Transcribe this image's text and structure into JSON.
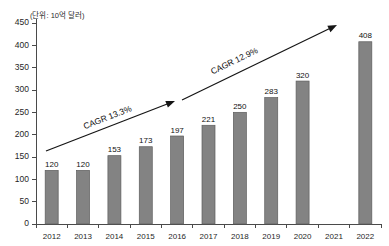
{
  "chart_data": {
    "type": "bar",
    "title": "",
    "subtitle": "",
    "unit_note": "(단위: 10억 달러)",
    "xlabel": "",
    "ylabel": "",
    "ylim": [
      0,
      450
    ],
    "ytick_step": 50,
    "grid": false,
    "legend": "none",
    "categories": [
      "2012",
      "2013",
      "2014",
      "2015",
      "2016",
      "2017",
      "2018",
      "2019",
      "2020",
      "2021",
      "2022"
    ],
    "values": [
      120,
      120,
      153,
      173,
      197,
      221,
      250,
      283,
      320,
      null,
      408
    ],
    "value_labels": [
      "120",
      "120",
      "153",
      "173",
      "197",
      "221",
      "250",
      "283",
      "320",
      "",
      "408"
    ],
    "ytick_labels": [
      "0",
      "50",
      "100",
      "150",
      "200",
      "250",
      "300",
      "350",
      "400",
      "450"
    ],
    "ytick_values": [
      0,
      50,
      100,
      150,
      200,
      250,
      300,
      350,
      400,
      450
    ],
    "annotations": [
      {
        "name": "cagr-first-period",
        "text": "CAGR 13.3%",
        "from_category": "2012",
        "to_category": "2016",
        "style": "arrow"
      },
      {
        "name": "cagr-second-period",
        "text": "CAGR 12.9%",
        "from_category": "2016",
        "to_category": "2022",
        "style": "arrow"
      }
    ],
    "colors": {
      "bar_fill": "#838383",
      "bar_stroke": "#5d5d5d",
      "axis": "#4a4a4a",
      "text": "#1f1f1f",
      "arrow": "#151515",
      "background": "#ffffff"
    }
  }
}
